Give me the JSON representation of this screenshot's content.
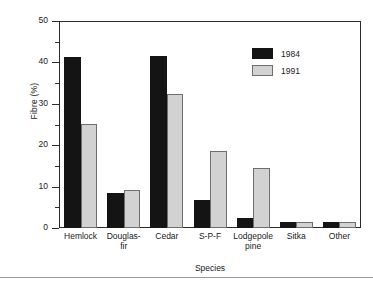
{
  "chart_data": {
    "type": "bar",
    "title": "",
    "xlabel": "Species",
    "ylabel": "Fibre (%)",
    "ylim": [
      0,
      50
    ],
    "yticks": [
      0,
      10,
      20,
      30,
      40,
      50
    ],
    "yticks_minor": [
      5,
      15,
      25,
      35,
      45
    ],
    "grid": false,
    "legend_position": "top-right",
    "categories": [
      "Hemlock",
      "Douglas-fir",
      "Cedar",
      "S-P-F",
      "Lodgepole pine",
      "Sitka",
      "Other"
    ],
    "category_lines": [
      [
        "Hemlock"
      ],
      [
        "Douglas-",
        "fir"
      ],
      [
        "Cedar"
      ],
      [
        "S-P-F"
      ],
      [
        "Lodgepole",
        "pine"
      ],
      [
        "Sitka"
      ],
      [
        "Other"
      ]
    ],
    "series": [
      {
        "name": "1984",
        "color": "#141414",
        "values": [
          41.2,
          8.5,
          41.5,
          6.7,
          2.4,
          1.4,
          1.5
        ]
      },
      {
        "name": "1991",
        "color": "#d2d2d2",
        "values": [
          25.1,
          9.2,
          32.3,
          18.5,
          14.6,
          1.4,
          1.5
        ]
      }
    ]
  },
  "axes": {
    "y_label": "Fibre (%)",
    "x_label": "Species",
    "y_tick_labels": [
      "0",
      "10",
      "20",
      "30",
      "40",
      "50"
    ]
  },
  "legend": {
    "entries": [
      {
        "label": "1984"
      },
      {
        "label": "1991"
      }
    ]
  }
}
